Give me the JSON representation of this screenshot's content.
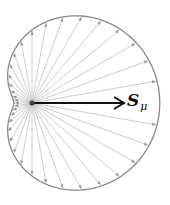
{
  "diagram": {
    "type": "polar-vector-field",
    "origin": [
      32,
      103
    ],
    "curve": {
      "formula": "r = a(1 + b cos(theta))",
      "a": 73,
      "b": 0.75,
      "color": "#888888"
    },
    "arrows": {
      "count": 36,
      "step_deg": 10,
      "color": "#999999"
    },
    "main_vector": {
      "label": "S",
      "subscript": "μ",
      "tip": [
        124,
        103
      ],
      "color": "#111111"
    }
  }
}
